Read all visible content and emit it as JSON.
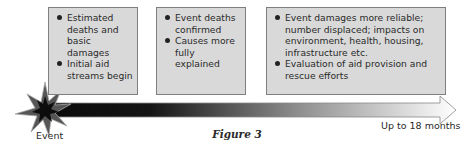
{
  "boxes": [
    {
      "items": [
        "Estimated deaths and basic damages",
        "Initial aid streams begin"
      ]
    },
    {
      "items": [
        "Event deaths confirmed",
        "Causes more fully explained"
      ]
    },
    {
      "items": [
        "Event damages more reliable; number displaced; impacts on environment, health, housing, infrastructure etc.",
        "Evaluation of aid provision and rescue efforts"
      ]
    }
  ],
  "timeline": {
    "start_label": "Event",
    "end_label": "Up to 18 months",
    "start_icon": "starburst-icon",
    "end_icon": "arrow-head-icon"
  },
  "caption": "Figure 3",
  "colors": {
    "box_fill": "#d9d9d9",
    "box_border": "#7f7f7f",
    "arrow_dark": "#111111",
    "arrow_light": "#ffffff"
  }
}
